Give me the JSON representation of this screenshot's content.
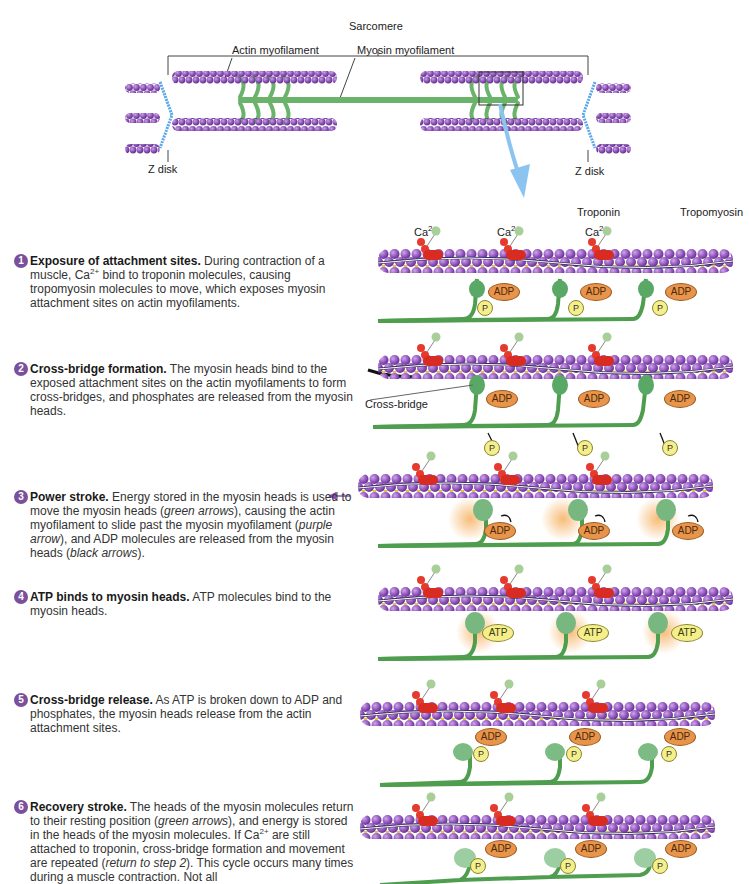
{
  "overview": {
    "sarcomere_label": "Sarcomere",
    "actin_label": "Actin myofilament",
    "myosin_label": "Myosin myofilament",
    "zdisk_left_label": "Z disk",
    "zdisk_right_label": "Z disk"
  },
  "panel_labels": {
    "troponin": "Troponin",
    "tropomyosin": "Tropomyosin",
    "ca": "Ca",
    "ca_charge": "2+",
    "cross_bridge": "Cross-bridge",
    "adp": "ADP",
    "atp": "ATP",
    "p": "P"
  },
  "colors": {
    "actin": "#8a4fb5",
    "myosin": "#5aa05a",
    "troponin": "#d83030",
    "calcium": "#a8cf98",
    "adp": "#e8944a",
    "phosphate": "#f4ef8a",
    "zdisk": "#5aa8e8",
    "step_badge": "#7a4f9c",
    "glow": "#f7c070"
  },
  "steps": [
    {
      "num": "1",
      "title": "Exposure of attachment sites.",
      "pre": " During contraction of a muscle, Ca",
      "sup": "2+",
      "post": " bind to troponin molecules, causing tropomyosin molecules to move, which exposes myosin attachment sites on actin myofilaments."
    },
    {
      "num": "2",
      "title": "Cross-bridge formation.",
      "pre": " The myosin heads bind to the exposed attachment sites on the actin myofilaments to form cross-bridges, and phosphates are released from the myosin heads.",
      "sup": "",
      "post": ""
    },
    {
      "num": "3",
      "title": "Power stroke.",
      "pre": " Energy stored in the myosin heads is used to move the myosin heads (",
      "i1": "green arrows",
      "mid1": "), causing the actin myofilament to slide past the myosin myofilament (",
      "i2": "purple arrow",
      "mid2": "), and ADP molecules are released from the myosin heads (",
      "i3": "black arrows",
      "post": ")."
    },
    {
      "num": "4",
      "title": "ATP binds to myosin heads.",
      "pre": " ATP molecules bind to the myosin heads.",
      "sup": "",
      "post": ""
    },
    {
      "num": "5",
      "title": "Cross-bridge release.",
      "pre": " As ATP is broken down to ADP and phosphates, the myosin heads release from the actin attachment sites.",
      "sup": "",
      "post": ""
    },
    {
      "num": "6",
      "title": "Recovery stroke.",
      "pre": " The heads of the myosin molecules return to their resting position (",
      "i1": "green arrows",
      "mid1": "), and energy is stored in the heads of the myosin molecules. If Ca",
      "sup": "2+",
      "mid2": " are still attached to troponin, cross-bridge formation and movement are repeated (",
      "i2": "return to step 2",
      "post": "). This cycle occurs many times during a muscle contraction. Not all"
    }
  ]
}
